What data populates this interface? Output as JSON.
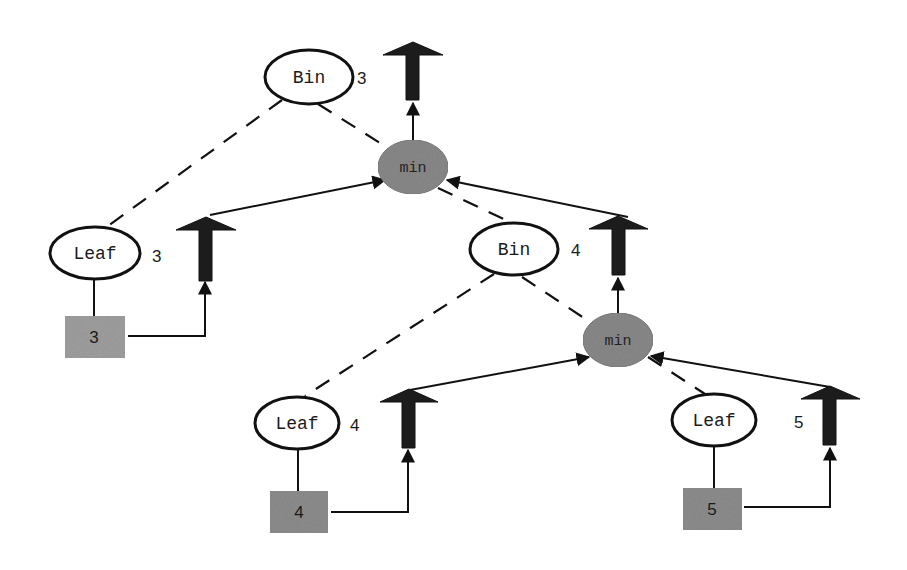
{
  "diagram": {
    "colors": {
      "background": "#ffffff",
      "stroke": "#111111",
      "min_fill": "#8a8a8a",
      "box_fill": "#9a9a9a",
      "arrow_fill": "#1c1c1c"
    },
    "nodes": {
      "bin_top": {
        "label": "Bin",
        "value": "3"
      },
      "min_top": {
        "label": "min"
      },
      "leaf_left": {
        "label": "Leaf",
        "value": "3"
      },
      "box_left": {
        "label": "3"
      },
      "bin_right": {
        "label": "Bin",
        "value": "4"
      },
      "min_right": {
        "label": "min"
      },
      "leaf_mid": {
        "label": "Leaf",
        "value": "4"
      },
      "box_mid": {
        "label": "4"
      },
      "leaf_right": {
        "label": "Leaf",
        "value": "5"
      },
      "box_right": {
        "label": "5"
      }
    }
  }
}
